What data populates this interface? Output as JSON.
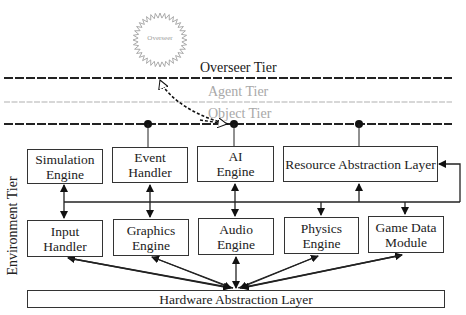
{
  "overseer": {
    "label": "Overseer"
  },
  "tiers": {
    "overseer": "Overseer Tier",
    "agent": "Agent Tier",
    "object": "Object Tier",
    "environment": "Environment Tier"
  },
  "top_row": [
    {
      "id": "simulation-engine",
      "label": "Simulation Engine"
    },
    {
      "id": "event-handler",
      "label": "Event Handler"
    },
    {
      "id": "ai-engine",
      "label": "AI Engine"
    },
    {
      "id": "resource-abstraction-layer",
      "label": "Resource Abstraction Layer"
    }
  ],
  "bottom_row": [
    {
      "id": "input-handler",
      "label": "Input Handler"
    },
    {
      "id": "graphics-engine",
      "label": "Graphics Engine"
    },
    {
      "id": "audio-engine",
      "label": "Audio Engine"
    },
    {
      "id": "physics-engine",
      "label": "Physics Engine"
    },
    {
      "id": "game-data-module",
      "label": "Game Data Module"
    }
  ],
  "base": {
    "label": "Hardware Abstraction Layer"
  },
  "colors": {
    "line": "#222222",
    "faded": "#a8a8a8"
  }
}
